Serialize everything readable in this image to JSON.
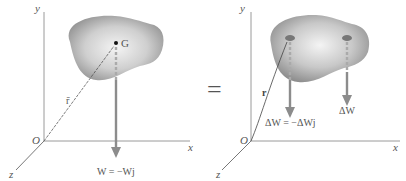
{
  "left_panel": {
    "axis_y": "y",
    "axis_x": "x",
    "axis_z": "z",
    "origin": "O",
    "center_label": "G",
    "position_vector": "r̄",
    "weight_label": "W = −Wj"
  },
  "equals_sign": "=",
  "right_panel": {
    "axis_y": "y",
    "axis_x": "x",
    "axis_z": "z",
    "origin": "O",
    "position_vector": "r",
    "element_weight_label": "ΔW = −ΔWj",
    "element_weight_label_2": "ΔW"
  },
  "colors": {
    "body_outer": "#8a8a8a",
    "body_inner": "#f2f2f2",
    "arrow": "#8c8c8c",
    "axis": "#9a9a9a",
    "text": "#555555"
  }
}
